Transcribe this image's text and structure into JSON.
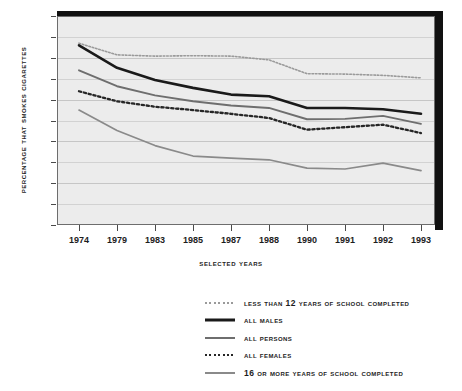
{
  "chart_data": {
    "type": "line",
    "title": "",
    "xlabel": "Selected Years",
    "ylabel": "Percentage That Smokes Cigarettes",
    "categories": [
      "1974",
      "1979",
      "1983",
      "1985",
      "1987",
      "1988",
      "1990",
      "1991",
      "1992",
      "1993"
    ],
    "x": [
      1974,
      1979,
      1983,
      1985,
      1987,
      1988,
      1990,
      1991,
      1992,
      1993
    ],
    "ylim": [
      0,
      50
    ],
    "ytick_labels": [
      "0",
      "5",
      "10",
      "15",
      "20",
      "25",
      "30",
      "35",
      "40",
      "45",
      "50"
    ],
    "ytick_values": [
      0,
      5,
      10,
      15,
      20,
      25,
      30,
      35,
      40,
      45,
      50
    ],
    "grid": true,
    "legend_position": "below",
    "series": [
      {
        "name": "Less Than 12 Years of School Completed",
        "style": "dotted",
        "color": "#9a9a9a",
        "width": 1.6,
        "values": [
          43.5,
          40.7,
          40.4,
          40.5,
          40.4,
          39.5,
          36.2,
          36.1,
          35.8,
          35.2
        ]
      },
      {
        "name": "All Males",
        "style": "solid",
        "color": "#1a1a1a",
        "width": 2.6,
        "values": [
          43.0,
          37.6,
          34.7,
          32.8,
          31.2,
          30.8,
          28.0,
          28.0,
          27.7,
          26.6
        ]
      },
      {
        "name": "All Persons",
        "style": "solid",
        "color": "#6e6e6e",
        "width": 1.9,
        "values": [
          37.0,
          33.2,
          31.0,
          29.6,
          28.6,
          28.0,
          25.3,
          25.4,
          26.1,
          24.2
        ]
      },
      {
        "name": "All Females",
        "style": "dotted",
        "color": "#262626",
        "width": 2.3,
        "values": [
          32.0,
          29.6,
          28.3,
          27.5,
          26.6,
          25.6,
          22.8,
          23.4,
          24.0,
          22.0
        ]
      },
      {
        "name": "16 or More Years of School Completed",
        "style": "solid",
        "color": "#8a8a8a",
        "width": 1.7,
        "values": [
          27.5,
          22.6,
          19.0,
          16.5,
          16.0,
          15.6,
          13.6,
          13.4,
          14.8,
          13.0
        ]
      }
    ]
  },
  "legend": {
    "items": [
      {
        "label": "Less Than 12 Years of School Completed"
      },
      {
        "label": "All Males"
      },
      {
        "label": "All Persons"
      },
      {
        "label": "All Females"
      },
      {
        "label": "16 or More Years of School Completed"
      }
    ]
  }
}
